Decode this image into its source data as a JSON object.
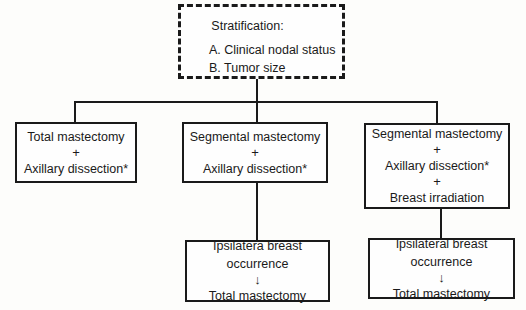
{
  "stratification": {
    "title": "Stratification:",
    "items": [
      "A. Clinical nodal status",
      "B. Tumor size"
    ]
  },
  "arms": [
    {
      "lines": [
        "Total mastectomy",
        "+",
        "Axillary dissection*"
      ]
    },
    {
      "lines": [
        "Segmental mastectomy",
        "+",
        "Axillary dissection*"
      ]
    },
    {
      "lines": [
        "Segmental mastectomy",
        "+",
        "Axillary dissection*",
        "+",
        "Breast irradiation"
      ]
    }
  ],
  "outcomes": [
    {
      "lines": [
        "Ipsilatera breast",
        "occurrence",
        "↓",
        "Total mastectomy"
      ]
    },
    {
      "lines": [
        "Ipsilateral breast",
        "occurrence",
        "↓",
        "Total mastectomy"
      ]
    }
  ]
}
